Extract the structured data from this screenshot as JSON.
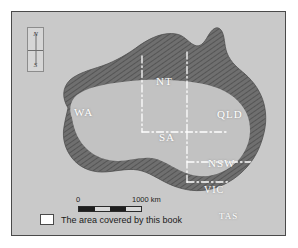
{
  "figure": {
    "frame_color": "#4a4a4a",
    "background_color": "#c9c9c9"
  },
  "compass": {
    "north_label": "N",
    "south_label": "S"
  },
  "map": {
    "land_fill_color": "#c2c2c2",
    "coastal_band_color": "#6e6e6e",
    "border_line_color": "#ffffff",
    "state_labels": [
      {
        "id": "wa",
        "label": "WA"
      },
      {
        "id": "nt",
        "label": "NT"
      },
      {
        "id": "qld",
        "label": "QLD"
      },
      {
        "id": "sa",
        "label": "SA"
      },
      {
        "id": "nsw",
        "label": "NSW"
      },
      {
        "id": "vic",
        "label": "VIC"
      },
      {
        "id": "tas",
        "label": "TAS"
      }
    ]
  },
  "scale_bar": {
    "min_label": "0",
    "max_label": "1000 km",
    "segments": 4
  },
  "legend": {
    "swatch_fill": "#ffffff",
    "text": "The area covered by this book"
  }
}
